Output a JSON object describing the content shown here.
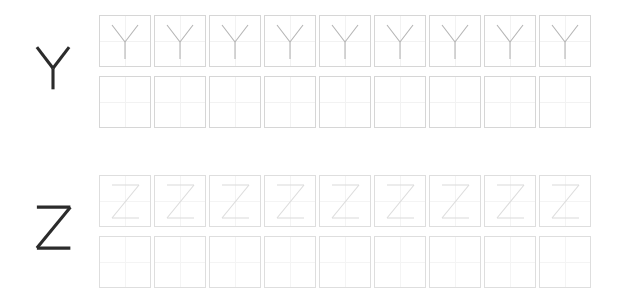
{
  "worksheet": {
    "type": "letter-tracing-practice",
    "columns": 9,
    "rows_per_letter": 2,
    "sections": [
      {
        "letter": "Y",
        "model_letter_label": "Y",
        "model_letter_color": "#2b2b2b",
        "trace_letter_color": "#b4b4b4",
        "box_border_color": "#d6d6d6",
        "guide_line_color": "#f2f2f2",
        "trace_row": {
          "row_label": "trace-row",
          "cells": [
            "Y",
            "Y",
            "Y",
            "Y",
            "Y",
            "Y",
            "Y",
            "Y",
            "Y"
          ]
        },
        "blank_row": {
          "row_label": "blank-row",
          "cells": [
            "",
            "",
            "",
            "",
            "",
            "",
            "",
            "",
            ""
          ]
        }
      },
      {
        "letter": "Z",
        "model_letter_label": "Z",
        "model_letter_color": "#2b2b2b",
        "trace_letter_color": "#dcdcdc",
        "box_border_color": "#dedede",
        "guide_line_color": "#f4f4f4",
        "trace_row": {
          "row_label": "trace-row",
          "cells": [
            "Z",
            "Z",
            "Z",
            "Z",
            "Z",
            "Z",
            "Z",
            "Z",
            "Z"
          ]
        },
        "blank_row": {
          "row_label": "blank-row",
          "cells": [
            "",
            "",
            "",
            "",
            "",
            "",
            "",
            "",
            ""
          ]
        }
      }
    ]
  }
}
